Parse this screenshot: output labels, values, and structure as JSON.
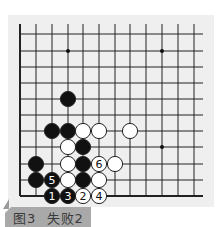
{
  "diagram": {
    "type": "go-board-partial",
    "grid": {
      "x_lines": [
        20,
        36,
        52,
        68,
        83,
        99,
        115,
        130,
        146,
        162,
        178,
        194
      ],
      "y_lines": [
        34,
        51,
        67,
        83,
        99,
        115,
        131,
        147,
        164,
        180,
        196
      ],
      "top_open_y": 24,
      "right_open_x": 203,
      "line_color": "#222222",
      "edge_left": true,
      "edge_bottom": true
    },
    "star_points": [
      {
        "x": 68,
        "y": 51
      },
      {
        "x": 162,
        "y": 51
      },
      {
        "x": 162,
        "y": 147
      }
    ],
    "stones": [
      {
        "color": "black",
        "x": 68,
        "y": 99,
        "label": ""
      },
      {
        "color": "black",
        "x": 52,
        "y": 131,
        "label": ""
      },
      {
        "color": "black",
        "x": 68,
        "y": 131,
        "label": ""
      },
      {
        "color": "white",
        "x": 83,
        "y": 131,
        "label": ""
      },
      {
        "color": "white",
        "x": 99,
        "y": 131,
        "label": ""
      },
      {
        "color": "white",
        "x": 130,
        "y": 131,
        "label": ""
      },
      {
        "color": "white",
        "x": 68,
        "y": 147,
        "label": ""
      },
      {
        "color": "black",
        "x": 83,
        "y": 147,
        "label": ""
      },
      {
        "color": "black",
        "x": 36,
        "y": 164,
        "label": ""
      },
      {
        "color": "white",
        "x": 68,
        "y": 164,
        "label": ""
      },
      {
        "color": "black",
        "x": 83,
        "y": 164,
        "label": ""
      },
      {
        "color": "white",
        "x": 99,
        "y": 164,
        "label": "6"
      },
      {
        "color": "white",
        "x": 115,
        "y": 164,
        "label": ""
      },
      {
        "color": "black",
        "x": 36,
        "y": 180,
        "label": ""
      },
      {
        "color": "black",
        "x": 52,
        "y": 180,
        "label": "5"
      },
      {
        "color": "white",
        "x": 68,
        "y": 180,
        "label": ""
      },
      {
        "color": "black",
        "x": 83,
        "y": 180,
        "label": ""
      },
      {
        "color": "white",
        "x": 99,
        "y": 180,
        "label": ""
      },
      {
        "color": "black",
        "x": 52,
        "y": 196,
        "label": "1"
      },
      {
        "color": "black",
        "x": 68,
        "y": 196,
        "label": "3"
      },
      {
        "color": "white",
        "x": 83,
        "y": 196,
        "label": "2"
      },
      {
        "color": "white",
        "x": 99,
        "y": 196,
        "label": "4"
      }
    ],
    "stone_radius": 7.6
  },
  "caption": {
    "text": "图3  失败2",
    "background": "#a9a9a9",
    "text_color": "#3a3a3a"
  },
  "colors": {
    "board_background": "#efefef",
    "black_stone": "#111111",
    "white_stone": "#ffffff",
    "stone_outline": "#222222"
  }
}
